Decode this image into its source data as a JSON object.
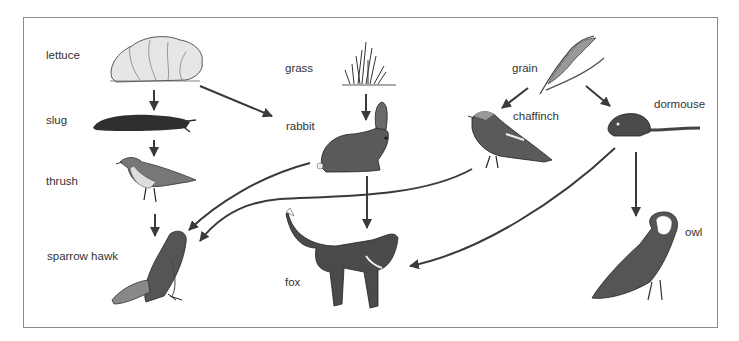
{
  "diagram": {
    "type": "food-web",
    "organisms": [
      {
        "id": "lettuce",
        "label": "lettuce",
        "role": "producer"
      },
      {
        "id": "grass",
        "label": "grass",
        "role": "producer"
      },
      {
        "id": "grain",
        "label": "grain",
        "role": "producer"
      },
      {
        "id": "slug",
        "label": "slug",
        "role": "primary consumer"
      },
      {
        "id": "rabbit",
        "label": "rabbit",
        "role": "primary consumer"
      },
      {
        "id": "chaffinch",
        "label": "chaffinch",
        "role": "primary consumer"
      },
      {
        "id": "dormouse",
        "label": "dormouse",
        "role": "primary consumer"
      },
      {
        "id": "thrush",
        "label": "thrush",
        "role": "secondary consumer"
      },
      {
        "id": "sparrow_hawk",
        "label": "sparrow hawk",
        "role": "predator"
      },
      {
        "id": "fox",
        "label": "fox",
        "role": "predator"
      },
      {
        "id": "owl",
        "label": "owl",
        "role": "predator"
      }
    ],
    "arrows": [
      {
        "from": "lettuce",
        "to": "slug"
      },
      {
        "from": "lettuce",
        "to": "rabbit"
      },
      {
        "from": "grass",
        "to": "rabbit"
      },
      {
        "from": "grain",
        "to": "chaffinch"
      },
      {
        "from": "grain",
        "to": "dormouse"
      },
      {
        "from": "slug",
        "to": "thrush"
      },
      {
        "from": "thrush",
        "to": "sparrow_hawk"
      },
      {
        "from": "rabbit",
        "to": "sparrow_hawk"
      },
      {
        "from": "rabbit",
        "to": "fox"
      },
      {
        "from": "chaffinch",
        "to": "sparrow_hawk"
      },
      {
        "from": "dormouse",
        "to": "fox"
      },
      {
        "from": "dormouse",
        "to": "owl"
      }
    ]
  },
  "labels": {
    "lettuce": "lettuce",
    "slug": "slug",
    "thrush": "thrush",
    "sparrow_hawk": "sparrow hawk",
    "grass": "grass",
    "rabbit": "rabbit",
    "fox": "fox",
    "grain": "grain",
    "chaffinch": "chaffinch",
    "dormouse": "dormouse",
    "owl": "owl"
  }
}
